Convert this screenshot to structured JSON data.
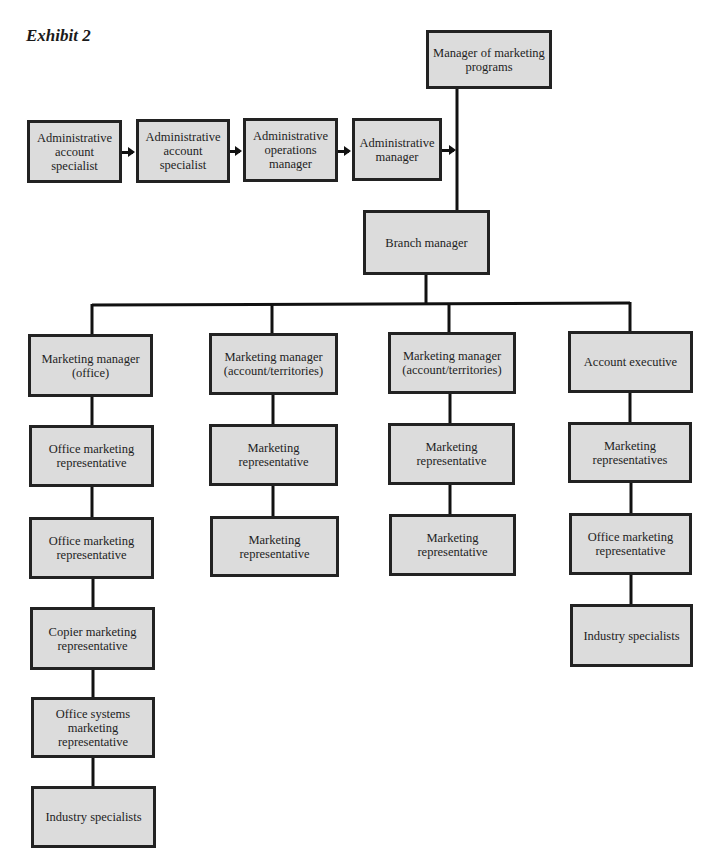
{
  "title": "Exhibit 2",
  "colors": {
    "box_fill": "#dcdcdc",
    "box_border": "#222222",
    "line": "#111111",
    "background": "#ffffff"
  },
  "top": {
    "manager_of_marketing_programs": "Manager of marketing programs",
    "branch_manager": "Branch manager"
  },
  "admin_chain": [
    {
      "label": "Administrative account specialist"
    },
    {
      "label": "Administrative account specialist"
    },
    {
      "label": "Administrative operations manager"
    },
    {
      "label": "Administrative manager"
    }
  ],
  "columns": [
    {
      "head": "Marketing manager (office)",
      "children": [
        "Office marketing representative",
        "Office marketing representative",
        "Copier marketing representative",
        "Office systems marketing representative",
        "Industry specialists"
      ]
    },
    {
      "head": "Marketing manager (account/territories)",
      "children": [
        "Marketing representative",
        "Marketing representative"
      ]
    },
    {
      "head": "Marketing manager (account/territories)",
      "children": [
        "Marketing representative",
        "Marketing representative"
      ]
    },
    {
      "head": "Account executive",
      "children": [
        "Marketing representatives",
        "Office marketing representative",
        "Industry specialists"
      ]
    }
  ]
}
